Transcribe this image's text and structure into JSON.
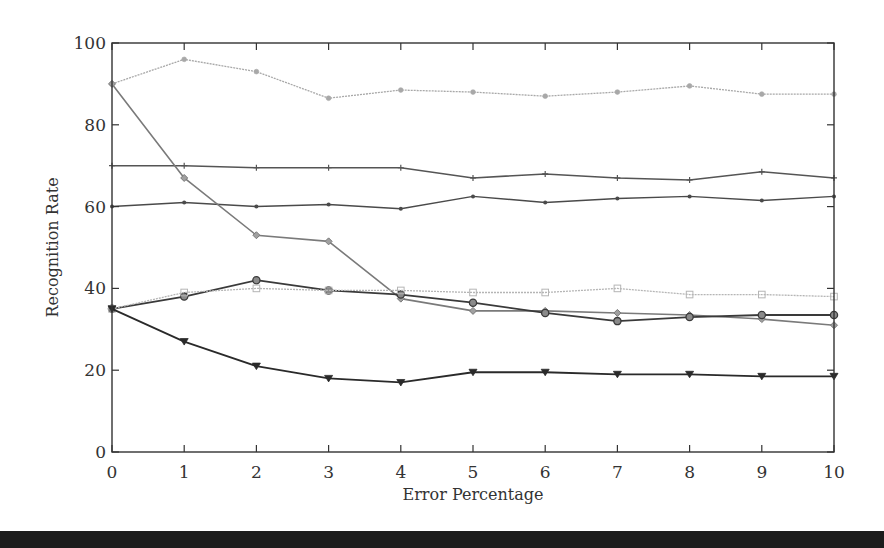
{
  "chart_data": {
    "type": "line",
    "title": "",
    "xlabel": "Error Percentage",
    "ylabel": "Recognition Rate",
    "x": [
      0,
      1,
      2,
      3,
      4,
      5,
      6,
      7,
      8,
      9,
      10
    ],
    "xlim": [
      0,
      10
    ],
    "ylim": [
      0,
      100
    ],
    "xticks": [
      "0",
      "1",
      "2",
      "3",
      "4",
      "5",
      "6",
      "7",
      "8",
      "9",
      "10"
    ],
    "yticks": [
      "0",
      "20",
      "40",
      "60",
      "80",
      "100"
    ],
    "grid": false,
    "legend": null,
    "series": [
      {
        "name": "series-1",
        "marker": "star",
        "color": "#a8a8a8",
        "dash": "2,1",
        "width": 1.3,
        "values": [
          90,
          96,
          93,
          86.5,
          88.5,
          88,
          87,
          88,
          89.5,
          87.5,
          87.5
        ]
      },
      {
        "name": "series-2",
        "marker": "plus",
        "color": "#555555",
        "dash": "",
        "width": 1.5,
        "values": [
          70,
          70,
          69.5,
          69.5,
          69.5,
          67,
          68,
          67,
          66.5,
          68.5,
          67
        ]
      },
      {
        "name": "series-3",
        "marker": "dot",
        "color": "#4a4a4a",
        "dash": "",
        "width": 1.5,
        "values": [
          60,
          61,
          60,
          60.5,
          59.5,
          62.5,
          61,
          62,
          62.5,
          61.5,
          62.5
        ]
      },
      {
        "name": "series-4",
        "marker": "diamond",
        "color": "#7a7a7a",
        "dash": "",
        "width": 1.6,
        "values": [
          90,
          67,
          53,
          51.5,
          37.5,
          34.5,
          34.5,
          34,
          33.5,
          32.5,
          31
        ]
      },
      {
        "name": "series-5",
        "marker": "circle",
        "color": "#3a3a3a",
        "dash": "",
        "width": 1.8,
        "values": [
          35,
          38,
          42,
          39.5,
          38.5,
          36.5,
          34,
          32,
          33,
          33.5,
          33.5
        ]
      },
      {
        "name": "series-6",
        "marker": "square",
        "color": "#b5b5b5",
        "dash": "2,1",
        "width": 1.3,
        "values": [
          35,
          39,
          40,
          39.5,
          39.5,
          39,
          39,
          40,
          38.5,
          38.5,
          38
        ]
      },
      {
        "name": "series-7",
        "marker": "triangle-down",
        "color": "#2a2a2a",
        "dash": "",
        "width": 1.8,
        "values": [
          35,
          27,
          21,
          18,
          17,
          19.5,
          19.5,
          19,
          19,
          18.5,
          18.5
        ]
      }
    ]
  },
  "layout": {
    "plot_left": 112,
    "plot_right": 834,
    "plot_top": 43,
    "plot_bottom": 452
  }
}
